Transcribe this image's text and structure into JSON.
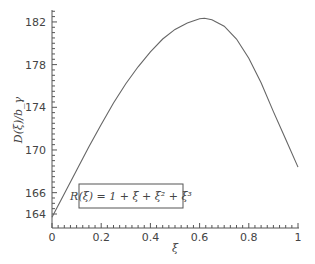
{
  "chart_data": {
    "type": "line",
    "title": "",
    "xlabel": "ξ",
    "ylabel": "D(ξ)/b_γ",
    "xlim": [
      0,
      1
    ],
    "ylim": [
      163.3,
      183
    ],
    "xticks": [
      "0",
      "0.2",
      "0.4",
      "0.6",
      "0.8",
      "1"
    ],
    "yticks": [
      "164",
      "166",
      "170",
      "174",
      "178",
      "182"
    ],
    "grid": false,
    "annotation": "R(ξ) = 1 + ξ + ξ² + ξ³",
    "series": [
      {
        "name": "D(ξ)/b_γ",
        "x": [
          0,
          0.05,
          0.1,
          0.15,
          0.2,
          0.25,
          0.3,
          0.35,
          0.4,
          0.45,
          0.5,
          0.55,
          0.6,
          0.62,
          0.65,
          0.7,
          0.75,
          0.8,
          0.85,
          0.9,
          0.95,
          1.0
        ],
        "y": [
          163.7,
          165.9,
          168.1,
          170.3,
          172.4,
          174.4,
          176.2,
          177.8,
          179.2,
          180.4,
          181.3,
          181.9,
          182.3,
          182.35,
          182.2,
          181.6,
          180.4,
          178.6,
          176.3,
          173.6,
          171.0,
          168.4
        ]
      }
    ]
  }
}
